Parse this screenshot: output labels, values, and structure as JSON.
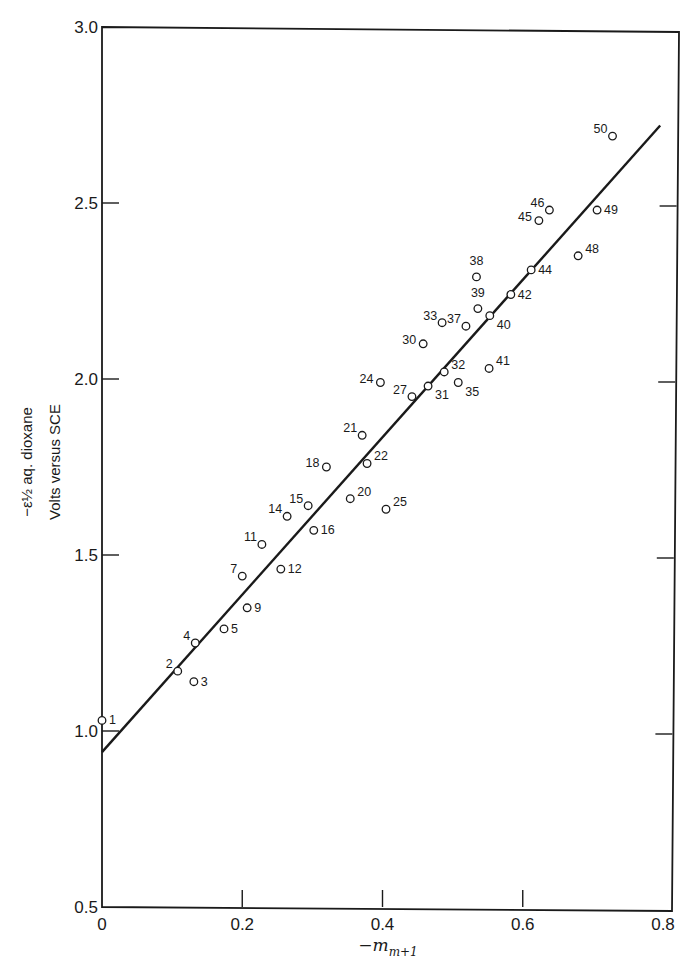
{
  "chart_data": {
    "type": "scatter",
    "title": "",
    "xlabel": "−m m+1",
    "xlabel_main": "−m",
    "xlabel_sub": "m+1",
    "ylabel_line1": "−ε½ aq. dioxane",
    "ylabel_line2": "Volts versus SCE",
    "xlim": [
      0,
      0.8
    ],
    "ylim": [
      0.5,
      3.0
    ],
    "x_ticks": [
      0,
      0.2,
      0.4,
      0.6,
      0.8
    ],
    "x_tick_labels": [
      "0",
      "0.2",
      "0.4",
      "0.6",
      "0.8"
    ],
    "y_ticks": [
      0.5,
      1.0,
      1.5,
      2.0,
      2.5,
      3.0
    ],
    "y_tick_labels": [
      "0.5",
      "1.0",
      "1.5",
      "2.0",
      "2.5",
      "3.0"
    ],
    "grid": false,
    "legend": null,
    "marker": "open-circle",
    "series": [
      {
        "name": "compounds",
        "points": [
          {
            "label": "1",
            "x": 0.0,
            "y": 1.03,
            "label_pos": "right"
          },
          {
            "label": "2",
            "x": 0.108,
            "y": 1.17,
            "label_pos": "upper-left"
          },
          {
            "label": "3",
            "x": 0.131,
            "y": 1.14,
            "label_pos": "right"
          },
          {
            "label": "4",
            "x": 0.133,
            "y": 1.25,
            "label_pos": "upper-left"
          },
          {
            "label": "5",
            "x": 0.174,
            "y": 1.29,
            "label_pos": "right"
          },
          {
            "label": "7",
            "x": 0.2,
            "y": 1.44,
            "label_pos": "upper-left"
          },
          {
            "label": "9",
            "x": 0.207,
            "y": 1.35,
            "label_pos": "right"
          },
          {
            "label": "11",
            "x": 0.228,
            "y": 1.53,
            "label_pos": "upper-left"
          },
          {
            "label": "12",
            "x": 0.255,
            "y": 1.46,
            "label_pos": "right"
          },
          {
            "label": "14",
            "x": 0.264,
            "y": 1.61,
            "label_pos": "upper-left"
          },
          {
            "label": "15",
            "x": 0.294,
            "y": 1.64,
            "label_pos": "upper-left"
          },
          {
            "label": "16",
            "x": 0.302,
            "y": 1.57,
            "label_pos": "right"
          },
          {
            "label": "18",
            "x": 0.32,
            "y": 1.75,
            "label_pos": "left"
          },
          {
            "label": "20",
            "x": 0.354,
            "y": 1.66,
            "label_pos": "upper-right"
          },
          {
            "label": "21",
            "x": 0.371,
            "y": 1.84,
            "label_pos": "upper-left"
          },
          {
            "label": "22",
            "x": 0.378,
            "y": 1.76,
            "label_pos": "upper-right"
          },
          {
            "label": "24",
            "x": 0.397,
            "y": 1.99,
            "label_pos": "left"
          },
          {
            "label": "25",
            "x": 0.405,
            "y": 1.63,
            "label_pos": "upper-right"
          },
          {
            "label": "27",
            "x": 0.442,
            "y": 1.95,
            "label_pos": "upper-left"
          },
          {
            "label": "30",
            "x": 0.458,
            "y": 2.1,
            "label_pos": "left"
          },
          {
            "label": "31",
            "x": 0.465,
            "y": 1.98,
            "label_pos": "lower-right"
          },
          {
            "label": "32",
            "x": 0.488,
            "y": 2.02,
            "label_pos": "upper-right"
          },
          {
            "label": "33",
            "x": 0.485,
            "y": 2.16,
            "label_pos": "upper-left"
          },
          {
            "label": "35",
            "x": 0.508,
            "y": 1.99,
            "label_pos": "lower-right"
          },
          {
            "label": "37",
            "x": 0.519,
            "y": 2.15,
            "label_pos": "upper-left"
          },
          {
            "label": "38",
            "x": 0.534,
            "y": 2.29,
            "label_pos": "above"
          },
          {
            "label": "39",
            "x": 0.536,
            "y": 2.2,
            "label_pos": "above"
          },
          {
            "label": "40",
            "x": 0.553,
            "y": 2.18,
            "label_pos": "lower-right"
          },
          {
            "label": "41",
            "x": 0.552,
            "y": 2.03,
            "label_pos": "upper-right"
          },
          {
            "label": "42",
            "x": 0.583,
            "y": 2.24,
            "label_pos": "right"
          },
          {
            "label": "44",
            "x": 0.612,
            "y": 2.31,
            "label_pos": "right"
          },
          {
            "label": "45",
            "x": 0.623,
            "y": 2.45,
            "label_pos": "left"
          },
          {
            "label": "46",
            "x": 0.638,
            "y": 2.48,
            "label_pos": "upper-left"
          },
          {
            "label": "48",
            "x": 0.679,
            "y": 2.35,
            "label_pos": "upper-right"
          },
          {
            "label": "49",
            "x": 0.706,
            "y": 2.48,
            "label_pos": "right"
          },
          {
            "label": "50",
            "x": 0.728,
            "y": 2.69,
            "label_pos": "upper-left"
          }
        ]
      }
    ],
    "fit_line": {
      "x0": 0.0,
      "y0": 0.94,
      "x1": 0.796,
      "y1": 2.72
    }
  },
  "style": {
    "ink": "#1a1a1a",
    "background": "#ffffff"
  }
}
